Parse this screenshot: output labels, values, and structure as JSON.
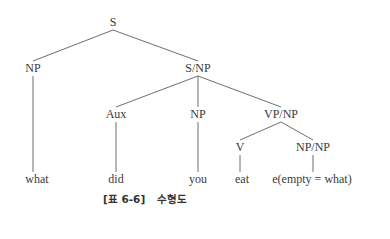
{
  "diagram": {
    "type": "syntax-tree",
    "nodes": [
      {
        "id": "S",
        "label": "S"
      },
      {
        "id": "NP1",
        "label": "NP"
      },
      {
        "id": "SNP",
        "label": "S/NP"
      },
      {
        "id": "Aux",
        "label": "Aux"
      },
      {
        "id": "NP2",
        "label": "NP"
      },
      {
        "id": "VPNP",
        "label": "VP/NP"
      },
      {
        "id": "V",
        "label": "V"
      },
      {
        "id": "NPNP",
        "label": "NP/NP"
      },
      {
        "id": "w_what",
        "label": "what"
      },
      {
        "id": "w_did",
        "label": "did"
      },
      {
        "id": "w_you",
        "label": "you"
      },
      {
        "id": "w_eat",
        "label": "eat"
      },
      {
        "id": "w_empty",
        "label": "e(empty = what)"
      }
    ],
    "edges": [
      [
        "S",
        "NP1"
      ],
      [
        "S",
        "SNP"
      ],
      [
        "NP1",
        "w_what"
      ],
      [
        "SNP",
        "Aux"
      ],
      [
        "SNP",
        "NP2"
      ],
      [
        "SNP",
        "VPNP"
      ],
      [
        "Aux",
        "w_did"
      ],
      [
        "NP2",
        "w_you"
      ],
      [
        "VPNP",
        "V"
      ],
      [
        "VPNP",
        "NPNP"
      ],
      [
        "V",
        "w_eat"
      ],
      [
        "NPNP",
        "w_empty"
      ]
    ]
  },
  "caption": {
    "number": "[표 6-6]",
    "title": "수형도"
  }
}
